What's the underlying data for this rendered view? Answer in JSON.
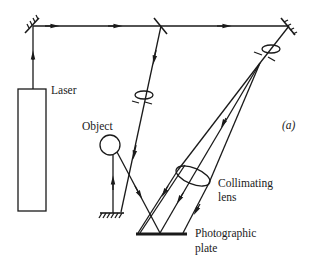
{
  "figure": {
    "panel_label": "(a)",
    "ink_color": "#1a1a1a",
    "background_color": "#ffffff"
  },
  "labels": {
    "laser": "Laser",
    "object": "Object",
    "collimating_lens_line1": "Collimating",
    "collimating_lens_line2": "lens",
    "plate_line1": "Photographic",
    "plate_line2": "plate",
    "panel": "(a)"
  },
  "components": [
    {
      "name": "laser",
      "type": "source"
    },
    {
      "name": "top-left-mirror",
      "type": "mirror"
    },
    {
      "name": "beam-splitter",
      "type": "beam-splitter"
    },
    {
      "name": "top-right-mirror",
      "type": "mirror"
    },
    {
      "name": "object-beam-lens",
      "type": "lens"
    },
    {
      "name": "reference-beam-lens",
      "type": "lens"
    },
    {
      "name": "object",
      "type": "object"
    },
    {
      "name": "bottom-mirror",
      "type": "mirror"
    },
    {
      "name": "collimating-lens",
      "type": "lens"
    },
    {
      "name": "photographic-plate",
      "type": "detector"
    }
  ]
}
